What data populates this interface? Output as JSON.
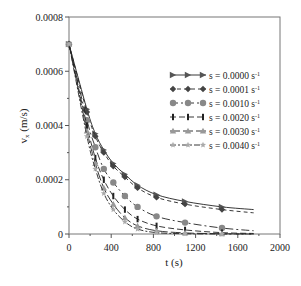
{
  "chart_data": {
    "type": "line",
    "title": "",
    "xlabel": "t (s)",
    "ylabel": "v_x (m/s)",
    "ylabel_main": "v",
    "ylabel_sub": "x",
    "ylabel_unit": " (m/s)",
    "xlim": [
      0,
      2000
    ],
    "ylim": [
      0,
      0.0008
    ],
    "xticks": [
      0,
      400,
      800,
      1200,
      1600,
      2000
    ],
    "xtick_labels": [
      "0",
      "400",
      "800",
      "1200",
      "1600",
      "2000"
    ],
    "yticks": [
      0,
      0.0002,
      0.0004,
      0.0006,
      0.0008
    ],
    "ytick_labels": [
      "0",
      "0.0002",
      "0.0004",
      "0.0006",
      "0.0008"
    ],
    "grid": false,
    "legend_position": "upper-right",
    "series": [
      {
        "name": "s = 0.0000 s-1",
        "label": "s = 0.0000 s",
        "sup": "-1",
        "color": "#555555",
        "marker": "triangle-right",
        "dash": "",
        "x": [
          0,
          170,
          250,
          330,
          420,
          530,
          650,
          830,
          1100,
          1450,
          1750
        ],
        "y": [
          0.0007,
          0.00046,
          0.00037,
          0.00031,
          0.00026,
          0.00022,
          0.00018,
          0.000145,
          0.00012,
          0.0001,
          9e-05
        ]
      },
      {
        "name": "s = 0.0001 s-1",
        "label": "s = 0.0001 s",
        "sup": "-1",
        "color": "#444444",
        "marker": "diamond",
        "dash": "4,3",
        "x": [
          0,
          170,
          250,
          330,
          420,
          530,
          650,
          830,
          1100,
          1450,
          1750
        ],
        "y": [
          0.0007,
          0.00045,
          0.00036,
          0.0003,
          0.00025,
          0.00021,
          0.00017,
          0.000135,
          0.00011,
          9e-05,
          7.8e-05
        ]
      },
      {
        "name": "s = 0.0010 s-1",
        "label": "s = 0.0010 s",
        "sup": "-1",
        "color": "#888888",
        "marker": "circle",
        "dash": "8,3,2,3",
        "x": [
          0,
          170,
          250,
          330,
          420,
          530,
          650,
          830,
          1100,
          1450,
          1750
        ],
        "y": [
          0.0007,
          0.00042,
          0.00032,
          0.00024,
          0.00019,
          0.00014,
          0.0001,
          6.5e-05,
          4.2e-05,
          2.2e-05,
          1.2e-05
        ]
      },
      {
        "name": "s = 0.0020 s-1",
        "label": "s = 0.0020 s",
        "sup": "-1",
        "color": "#222222",
        "marker": "bar",
        "dash": "6,3",
        "x": [
          0,
          170,
          250,
          330,
          420,
          530,
          650,
          830,
          1100,
          1450,
          1750
        ],
        "y": [
          0.0007,
          0.0004,
          0.00028,
          0.0002,
          0.00014,
          9e-05,
          5.5e-05,
          3e-05,
          1.5e-05,
          5e-06,
          2e-06
        ]
      },
      {
        "name": "s = 0.0030 s-1",
        "label": "s = 0.0030 s",
        "sup": "-1",
        "color": "#999999",
        "marker": "triangle-up",
        "dash": "10,3",
        "x": [
          0,
          170,
          250,
          330,
          420,
          530,
          650,
          830,
          1100,
          1450,
          1750
        ],
        "y": [
          0.0007,
          0.00038,
          0.00026,
          0.00017,
          0.00011,
          6e-05,
          3e-05,
          1.2e-05,
          4e-06,
          1e-06,
          0.0
        ]
      },
      {
        "name": "s = 0.0040 s-1",
        "label": "s = 0.0040 s",
        "sup": "-1",
        "color": "#aaaaaa",
        "marker": "star",
        "dash": "6,2,2,2",
        "x": [
          0,
          170,
          250,
          330,
          420,
          530,
          650,
          830,
          1100,
          1450,
          1750
        ],
        "y": [
          0.0007,
          0.00036,
          0.00024,
          0.00015,
          9e-05,
          4.5e-05,
          1.8e-05,
          5e-06,
          1e-06,
          0.0,
          0.0
        ]
      }
    ]
  }
}
